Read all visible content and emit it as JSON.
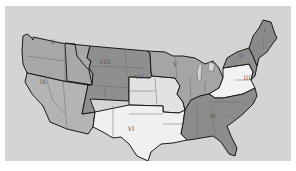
{
  "map": {
    "title": "",
    "background_color": "#d4d4d4",
    "regions": [
      {
        "id": "I",
        "label": "I",
        "shade": "#8a8a8a",
        "states": [
          "ME",
          "NH",
          "VT",
          "MA",
          "RI",
          "CT"
        ]
      },
      {
        "id": "II",
        "label": "II",
        "shade": "#8e8e8e",
        "states": [
          "NY",
          "NJ"
        ]
      },
      {
        "id": "III",
        "label": "III",
        "shade": "#f2f2f2",
        "states": [
          "PA",
          "WV",
          "VA",
          "MD",
          "DE"
        ]
      },
      {
        "id": "IV",
        "label": "IV",
        "shade": "#8c8c8c",
        "states": [
          "KY",
          "TN",
          "NC",
          "SC",
          "GA",
          "FL",
          "AL",
          "MS"
        ]
      },
      {
        "id": "V",
        "label": "V",
        "shade": "#a5a5a5",
        "states": [
          "MN",
          "WI",
          "MI",
          "IL",
          "IN",
          "OH"
        ]
      },
      {
        "id": "VI",
        "label": "VI",
        "shade": "#f0f0f0",
        "states": [
          "NM",
          "TX",
          "OK",
          "AR",
          "LA"
        ]
      },
      {
        "id": "VII",
        "label": "VII",
        "shade": "#e2e2e2",
        "states": [
          "NE",
          "KS",
          "IA",
          "MO"
        ]
      },
      {
        "id": "VIII",
        "label": "VIII",
        "shade": "#8f8f8f",
        "states": [
          "MT",
          "WY",
          "ND",
          "SD",
          "CO",
          "UT"
        ]
      },
      {
        "id": "IX",
        "label": "IX",
        "shade": "#b4b4b4",
        "states": [
          "CA",
          "NV",
          "AZ"
        ]
      },
      {
        "id": "X",
        "label": "X",
        "shade": "#a8a8a8",
        "states": [
          "WA",
          "OR",
          "ID"
        ]
      }
    ]
  }
}
